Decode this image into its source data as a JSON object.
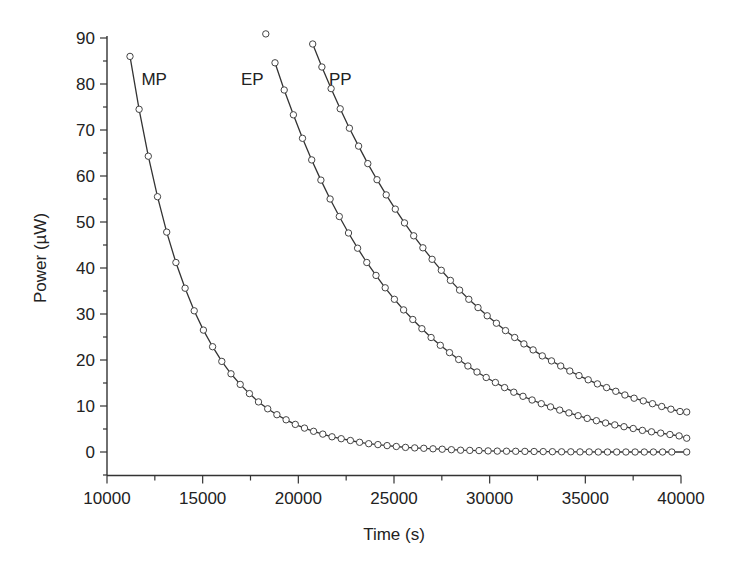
{
  "chart_data": {
    "type": "line",
    "title": "",
    "xlabel": "Time (s)",
    "ylabel": "Power (µW)",
    "xlim": [
      10000,
      40000
    ],
    "ylim": [
      -5,
      90
    ],
    "xticks": [
      10000,
      15000,
      20000,
      25000,
      30000,
      35000,
      40000
    ],
    "yticks": [
      0,
      10,
      20,
      30,
      40,
      50,
      60,
      70,
      80,
      90
    ],
    "grid": false,
    "legend": "inline labels",
    "series": [
      {
        "name": "MP",
        "label_pos": [
          11800,
          81
        ],
        "x": [
          11200,
          11680,
          12160,
          12640,
          13120,
          13600,
          14080,
          14560,
          15040,
          15520,
          16000,
          16480,
          16960,
          17440,
          17920,
          18400,
          18880,
          19360,
          19840,
          20320,
          20800,
          21280,
          21760,
          22240,
          22720,
          23200,
          23680,
          24160,
          24640,
          25120,
          25600,
          26080,
          26560,
          27040,
          27520,
          28000,
          28480,
          28960,
          29440,
          29920,
          30400,
          30880,
          31360,
          31840,
          32320,
          32800,
          33280,
          33760,
          34240,
          34720,
          35200,
          35680,
          36160,
          36640,
          37120,
          37600,
          38080,
          38560,
          39040,
          39520,
          40300
        ],
        "values": [
          86,
          74.5,
          64.3,
          55.5,
          47.8,
          41.2,
          35.6,
          30.7,
          26.5,
          22.9,
          19.7,
          17.0,
          14.7,
          12.7,
          10.9,
          9.4,
          8.1,
          7.0,
          6.0,
          5.2,
          4.5,
          3.9,
          3.3,
          2.9,
          2.5,
          2.1,
          1.8,
          1.6,
          1.4,
          1.2,
          1.0,
          0.9,
          0.8,
          0.7,
          0.6,
          0.5,
          0.4,
          0.35,
          0.3,
          0.25,
          0.2,
          0.17,
          0.15,
          0.12,
          0.1,
          0.08,
          0.06,
          0.05,
          0.04,
          0.03,
          0.02,
          0.01,
          0,
          0,
          0,
          0,
          0,
          0,
          0,
          0,
          0
        ]
      },
      {
        "name": "EP",
        "label_pos": [
          17000,
          81
        ],
        "x": [
          18300,
          18780,
          19260,
          19740,
          20220,
          20700,
          21180,
          21660,
          22140,
          22620,
          23100,
          23580,
          24060,
          24540,
          25020,
          25500,
          25980,
          26460,
          26940,
          27420,
          27900,
          28380,
          28860,
          29340,
          29820,
          30300,
          30780,
          31260,
          31740,
          32220,
          32700,
          33180,
          33660,
          34140,
          34620,
          35100,
          35580,
          36060,
          36540,
          37020,
          37500,
          37980,
          38460,
          38940,
          39420,
          39900,
          40300
        ],
        "values": [
          90.9,
          84.6,
          78.7,
          73.3,
          68.2,
          63.5,
          59.1,
          55.0,
          51.2,
          47.6,
          44.3,
          41.2,
          38.4,
          35.7,
          33.2,
          30.9,
          28.8,
          26.8,
          24.9,
          23.2,
          21.6,
          20.1,
          18.7,
          17.4,
          16.2,
          15.1,
          14.0,
          13.0,
          12.1,
          11.3,
          10.5,
          9.8,
          9.1,
          8.5,
          7.9,
          7.3,
          6.8,
          6.3,
          5.9,
          5.5,
          5.1,
          4.7,
          4.4,
          4.1,
          3.8,
          3.5,
          3.0
        ]
      },
      {
        "name": "PP",
        "label_pos": [
          21600,
          81
        ],
        "x": [
          20750,
          21230,
          21710,
          22190,
          22670,
          23150,
          23630,
          24110,
          24590,
          25070,
          25550,
          26030,
          26510,
          26990,
          27470,
          27950,
          28430,
          28910,
          29390,
          29870,
          30350,
          30830,
          31310,
          31790,
          32270,
          32750,
          33230,
          33710,
          34190,
          34670,
          35150,
          35630,
          36110,
          36590,
          37070,
          37550,
          38030,
          38510,
          38990,
          39470,
          39950,
          40300
        ],
        "values": [
          88.7,
          83.7,
          79.0,
          74.6,
          70.4,
          66.5,
          62.7,
          59.2,
          55.9,
          52.8,
          49.8,
          47.0,
          44.4,
          41.9,
          39.5,
          37.3,
          35.2,
          33.2,
          31.4,
          29.6,
          28.0,
          26.4,
          24.9,
          23.5,
          22.2,
          20.9,
          19.8,
          18.7,
          17.6,
          16.6,
          15.7,
          14.8,
          14.0,
          13.2,
          12.4,
          11.7,
          11.1,
          10.5,
          9.9,
          9.3,
          8.8,
          8.7
        ]
      }
    ]
  }
}
